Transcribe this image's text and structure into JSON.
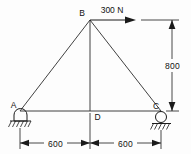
{
  "figure": {
    "type": "statics-truss-free-body-diagram",
    "background_color": "#fdfdfd",
    "line_color": "#1a1a1a"
  },
  "nodes": {
    "a": {
      "label": "A",
      "support": "pin-support",
      "x": 20,
      "y": 111
    },
    "b": {
      "label": "B",
      "support": "none",
      "x": 90,
      "y": 20
    },
    "c": {
      "label": "C",
      "support": "roller-support",
      "x": 161,
      "y": 111
    },
    "d": {
      "label": "D",
      "support": "none",
      "x": 90,
      "y": 111
    }
  },
  "load": {
    "magnitude": "300",
    "unit": "N",
    "label": "300 N",
    "direction": "right",
    "applied_at": "B"
  },
  "dimensions": {
    "height": {
      "value": "800",
      "orientation": "vertical",
      "from": "C",
      "to": "B"
    },
    "span_left": {
      "value": "600",
      "orientation": "horizontal",
      "from": "A",
      "to": "D"
    },
    "span_right": {
      "value": "600",
      "orientation": "horizontal",
      "from": "D",
      "to": "C"
    }
  },
  "members": [
    {
      "name": "AB",
      "from": "A",
      "to": "B"
    },
    {
      "name": "BC",
      "from": "B",
      "to": "C"
    },
    {
      "name": "AC",
      "from": "A",
      "to": "C"
    },
    {
      "name": "BD",
      "from": "B",
      "to": "D"
    }
  ]
}
